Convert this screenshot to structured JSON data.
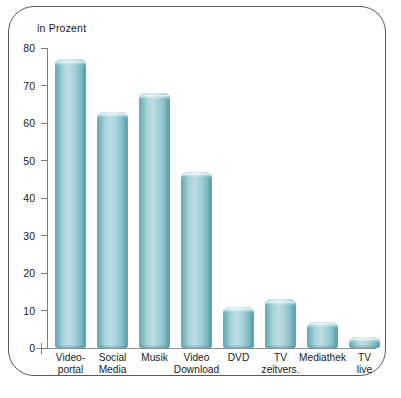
{
  "chart_data": {
    "type": "bar",
    "title": "in Prozent",
    "xlabel": "",
    "ylabel": "",
    "ylim": [
      0,
      80
    ],
    "yticks": [
      0,
      10,
      20,
      30,
      40,
      50,
      60,
      70,
      80
    ],
    "grid": false,
    "legend": null,
    "bar_color": "#8ec6cf",
    "categories": [
      "Video-portal",
      "Social Media",
      "Musik",
      "Video Download",
      "DVD",
      "TV zeitvers.",
      "Mediathek",
      "TV live"
    ],
    "category_lines": [
      [
        "Video-",
        "portal"
      ],
      [
        "Social",
        "Media"
      ],
      [
        "Musik",
        ""
      ],
      [
        "Video",
        "Download"
      ],
      [
        "DVD",
        ""
      ],
      [
        "TV",
        "zeitvers."
      ],
      [
        "Mediathek",
        ""
      ],
      [
        "TV",
        "live"
      ]
    ],
    "values": [
      77,
      63,
      68,
      47,
      11,
      13,
      7,
      3
    ]
  },
  "axis": {
    "tick_labels": [
      "80",
      "70",
      "60",
      "50",
      "40",
      "30",
      "20",
      "10",
      "0"
    ]
  }
}
